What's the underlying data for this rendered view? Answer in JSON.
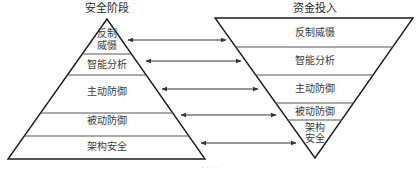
{
  "diagram": {
    "left_pyramid": {
      "title": "安全阶段",
      "layers": [
        {
          "label": "反制\n威慑",
          "line1": "反制",
          "line2": "威慑"
        },
        {
          "label": "智能分析"
        },
        {
          "label": "主动防御"
        },
        {
          "label": "被动防御"
        },
        {
          "label": "架构安全"
        }
      ]
    },
    "right_pyramid": {
      "title": "资金投入",
      "layers": [
        {
          "label": "反制威慑"
        },
        {
          "label": "智能分析"
        },
        {
          "label": "主动防御"
        },
        {
          "label": "被动防御"
        },
        {
          "label": "架构\n安全",
          "line1": "架构",
          "line2": "安全"
        }
      ]
    },
    "arrows": [
      {
        "from": "反制威慑",
        "to": "反制威慑",
        "type": "bidirectional"
      },
      {
        "from": "智能分析",
        "to": "智能分析",
        "type": "bidirectional"
      },
      {
        "from": "主动防御",
        "to": "主动防御",
        "type": "bidirectional"
      },
      {
        "from": "被动防御",
        "to": "被动防御",
        "type": "bidirectional"
      },
      {
        "from": "架构安全",
        "to": "架构安全",
        "type": "bidirectional"
      }
    ],
    "caption": "· · · ·",
    "colors": {
      "line": "#1a1a1a",
      "divider": "#555555",
      "arrow": "#333333"
    }
  }
}
